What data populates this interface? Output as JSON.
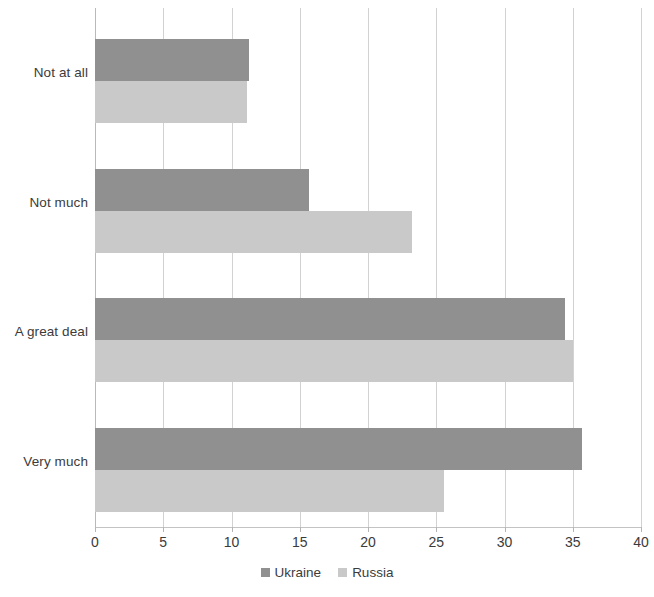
{
  "chart_data": {
    "type": "bar",
    "orientation": "horizontal",
    "title": "",
    "subtitle": "",
    "xlabel": "",
    "ylabel": "",
    "xlim": [
      0,
      40
    ],
    "xticks": [
      0,
      5,
      10,
      15,
      20,
      25,
      30,
      35,
      40
    ],
    "xtick_labels": [
      "0",
      "5",
      "10",
      "15",
      "20",
      "25",
      "30",
      "35",
      "40"
    ],
    "grid": "vertical",
    "legend_position": "bottom-center",
    "categories": [
      "Not at all",
      "Not much",
      "A great deal",
      "Very much"
    ],
    "series": [
      {
        "name": "Ukraine",
        "color": "#909090",
        "values": [
          11.3,
          15.7,
          34.4,
          35.7
        ]
      },
      {
        "name": "Russia",
        "color": "#c9c9c9",
        "values": [
          11.1,
          23.2,
          35.0,
          25.6
        ]
      }
    ],
    "annotations": []
  },
  "legend": {
    "items": [
      {
        "label": "Ukraine",
        "swatch": "series-ukraine"
      },
      {
        "label": "Russia",
        "swatch": "series-russia"
      }
    ]
  },
  "colors": {
    "series_ukraine": "#909090",
    "series_russia": "#c9c9c9",
    "gridline": "#d2d2d2",
    "text": "#3b3b3b",
    "background": "#ffffff"
  }
}
